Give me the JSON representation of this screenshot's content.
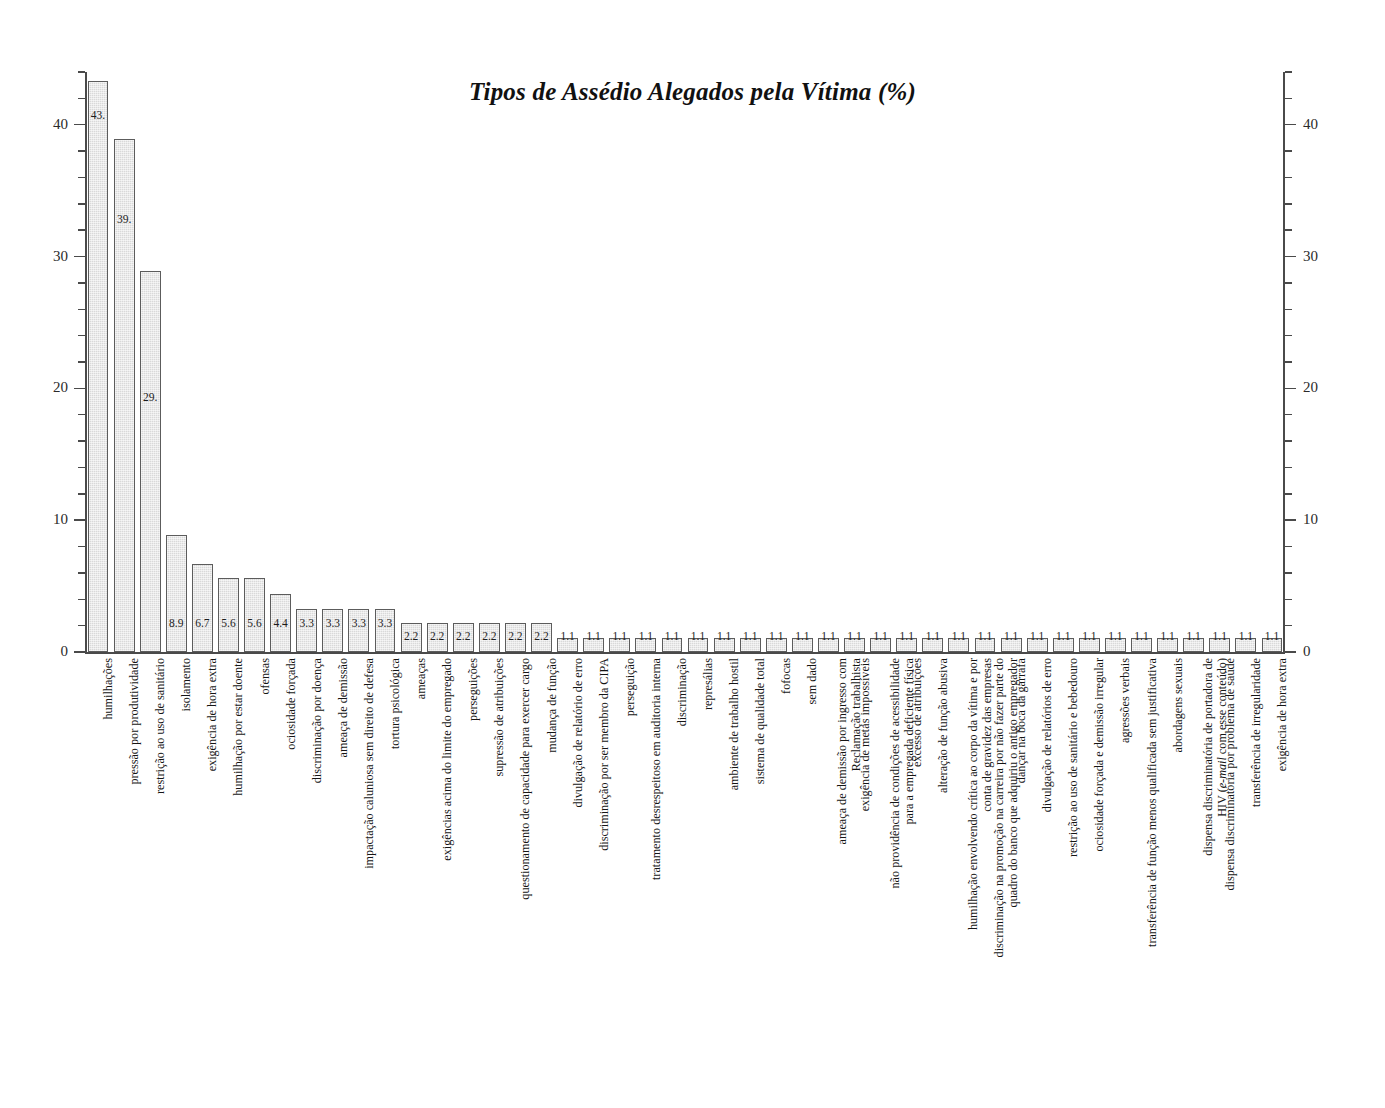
{
  "chart_data": {
    "type": "bar",
    "title": "Tipos de Assédio Alegados pela Vítima (%)",
    "subtitle": "",
    "xlabel": "",
    "ylabel": "",
    "ylim": [
      0,
      44
    ],
    "yticks": [
      0,
      10,
      20,
      30,
      40
    ],
    "ytick_labels": [
      "0",
      "10",
      "20",
      "30",
      "40"
    ],
    "minor_tick_step": 2,
    "grid": false,
    "legend": null,
    "axes": {
      "left_axis": true,
      "right_axis": true,
      "right_tick_labels": [
        "0",
        "10",
        "20",
        "30",
        "40"
      ]
    },
    "value_label_format": "shown inside or above each bar",
    "categories": [
      "humilhações",
      "pressão por produtividade",
      "restrição ao uso de sanitário",
      "isolamento",
      "exigência de hora extra",
      "humilhação por estar doente",
      "ofensas",
      "ociosidade forçada",
      "discriminação por doença",
      "ameaça de demissão",
      "impactação caluniosa sem direito de defesa",
      "tortura psicológica",
      "ameaças",
      "exigências acima do limite do empregado",
      "perseguições",
      "supressão de atribuições",
      "questionamento de capacidade para exercer cargo",
      "mudança de função",
      "divulgação de relatório de erro",
      "discriminação por ser membro da CIPA",
      "perseguição",
      "tratamento desrespeitoso em auditoria interna",
      "discriminação",
      "represálias",
      "ambiente de trabalho hostil",
      "sistema de qualidade total",
      "fofocas",
      "sem dado",
      "ameaça de demissão por ingresso com Reclamação trabalhista",
      "exigência de metas impossíveis",
      "não providência de condições de acessibilidade para a empregada deficiente física",
      "excesso de atribuições",
      "alteração de função abusiva",
      "humilhação envolvendo crítica ao corpo da vítima e por conta de gravidez das empresas",
      "discriminação na promoção na carreira por não fazer parte do quadro do banco que adquiriu o antigo empregador",
      "dançar na boca da garrafa",
      "divulgação de relatórios de erro",
      "restrição ao uso de sanitário e bebedouro",
      "ociosidade forçada e demissão irregular",
      "agressões verbais",
      "transferência de função menos qualificada sem justificativa",
      "abordagens sexuais",
      "dispensa discriminatória de portadora de HIV (e-mail com esse conteúdo)",
      "dispensa discriminatória por problema de saúde",
      "transferência de irregularidade",
      "exigência de hora extra"
    ],
    "values": [
      43.3,
      38.9,
      28.9,
      8.9,
      6.7,
      5.6,
      5.6,
      4.4,
      3.3,
      3.3,
      3.3,
      3.3,
      2.2,
      2.2,
      2.2,
      2.2,
      2.2,
      2.2,
      1.1,
      1.1,
      1.1,
      1.1,
      1.1,
      1.1,
      1.1,
      1.1,
      1.1,
      1.1,
      1.1,
      1.1,
      1.1,
      1.1,
      1.1,
      1.1,
      1.1,
      1.1,
      1.1,
      1.1,
      1.1,
      1.1,
      1.1,
      1.1,
      1.1,
      1.1,
      1.1,
      1.1
    ],
    "value_labels": [
      "43.",
      "39.",
      "29.",
      "8.9",
      "6.7",
      "5.6",
      "5.6",
      "4.4",
      "3.3",
      "3.3",
      "3.3",
      "3.3",
      "2.2",
      "2.2",
      "2.2",
      "2.2",
      "2.2",
      "2.2",
      "1.1",
      "1.1",
      "1.1",
      "1.1",
      "1.1",
      "1.1",
      "1.1",
      "1.1",
      "1.1",
      "1.1",
      "1.1",
      "1.1",
      "1.1",
      "1.1",
      "1.1",
      "1.1",
      "1.1",
      "1.1",
      "1.1",
      "1.1",
      "1.1",
      "1.1",
      "1.1",
      "1.1",
      "1.1",
      "1.1",
      "1.1",
      "1.1"
    ],
    "category_lines": [
      [
        "humilhações"
      ],
      [
        "pressão por produtividade"
      ],
      [
        "restrição ao uso de sanitário"
      ],
      [
        "isolamento"
      ],
      [
        "exigência de hora extra"
      ],
      [
        "humilhação por estar doente"
      ],
      [
        "ofensas"
      ],
      [
        "ociosidade forçada"
      ],
      [
        "discriminação por doença"
      ],
      [
        "ameaça de demissão"
      ],
      [
        "impactação caluniosa sem direito de defesa"
      ],
      [
        "tortura psicológica"
      ],
      [
        "ameaças"
      ],
      [
        "exigências acima do limite do empregado"
      ],
      [
        "perseguições"
      ],
      [
        "supressão de atribuições"
      ],
      [
        "questionamento de capacidade para exercer cargo"
      ],
      [
        "mudança de função"
      ],
      [
        "divulgação de relatório de erro"
      ],
      [
        "discriminação por ser membro da CIPA"
      ],
      [
        "perseguição"
      ],
      [
        "tratamento desrespeitoso em auditoria interna"
      ],
      [
        "discriminação"
      ],
      [
        "represálias"
      ],
      [
        "ambiente de trabalho hostil"
      ],
      [
        "sistema de qualidade total"
      ],
      [
        "fofocas"
      ],
      [
        "sem dado"
      ],
      [
        "ameaça de demissão por ingresso com",
        "Reclamação trabalhista"
      ],
      [
        "exigência de metas impossíveis"
      ],
      [
        "não providência de condições de acessibilidade",
        "para a empregada deficiente física"
      ],
      [
        "excesso de atribuições"
      ],
      [
        "alteração de função abusiva"
      ],
      [
        "humilhação envolvendo crítica ao corpo da vítima e por",
        "conta de gravidez das empresas"
      ],
      [
        "discriminação na promoção na carreira por não fazer parte do",
        "quadro do banco que adquiriu o antigo empregador"
      ],
      [
        "dançar na boca da garrafa"
      ],
      [
        "divulgação de relatórios de erro"
      ],
      [
        "restrição ao uso de sanitário e bebedouro"
      ],
      [
        "ociosidade forçada e demissão irregular"
      ],
      [
        "agressões verbais"
      ],
      [
        "transferência de função menos qualificada sem justificativa"
      ],
      [
        "abordagens sexuais"
      ],
      [
        "dispensa discriminatória de portadora de",
        "HIV (e-mail com esse conteúdo)"
      ],
      [
        "dispensa discriminatória por problema de saúde"
      ],
      [
        "transferência de irregularidade"
      ],
      [
        "exigência de hora extra"
      ]
    ],
    "colors": {
      "bar_fill": "#d9d9d9",
      "bar_edge": "#5c5c5c",
      "axis": "#4a4a4a",
      "text": "#1a1a1a",
      "background": "#ffffff"
    }
  }
}
